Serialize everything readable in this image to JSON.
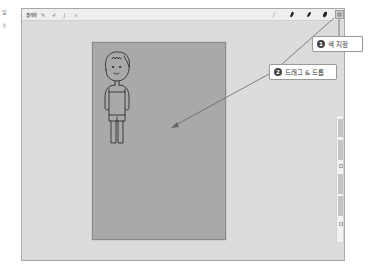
{
  "margin_text": [
    "일",
    "소"
  ],
  "toolbar": {
    "gallery_label": "갤러리",
    "tools": [
      {
        "icon": "wrench-icon",
        "glyph": "✎"
      },
      {
        "icon": "magic-wand-icon",
        "glyph": "✐"
      },
      {
        "icon": "selection-icon",
        "glyph": "∫"
      },
      {
        "icon": "transform-icon",
        "glyph": "➶"
      }
    ],
    "right_tools": [
      {
        "icon": "brush-icon"
      },
      {
        "icon": "smudge-icon"
      },
      {
        "icon": "eraser-icon"
      },
      {
        "icon": "layers-icon"
      }
    ],
    "color_button_color": "#9a9a9a"
  },
  "canvas": {
    "background_color": "#a9a9a9",
    "figure": "line-drawing-of-child"
  },
  "callouts": [
    {
      "number": "1",
      "label": "색 지정"
    },
    {
      "number": "2",
      "label": "드래그 & 드롭"
    }
  ],
  "colors": {
    "screen_bg": "#dcdcdc",
    "toolbar_bg": "#eeeeee",
    "canvas_border": "#8a8a8a",
    "callout_line": "#666666"
  }
}
